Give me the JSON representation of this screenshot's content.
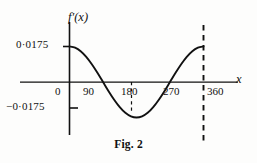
{
  "figure": {
    "caption": "Fig. 2",
    "axes": {
      "y_title": "f′(x)",
      "x_title": "x",
      "y_tick_positive": "0·0175",
      "y_tick_negative": "−0·0175",
      "origin_label": "0",
      "x_ticks": [
        "90",
        "180",
        "270",
        "360"
      ]
    },
    "colors": {
      "ink": "#111111",
      "background": "#fdfdfc",
      "curve": "#111111"
    }
  },
  "chart_data": {
    "type": "line",
    "title": "Fig. 2",
    "xlabel": "x",
    "ylabel": "f′(x)",
    "xlim": [
      0,
      375
    ],
    "ylim": [
      -0.0175,
      0.0175
    ],
    "xticks": [
      0,
      90,
      180,
      270,
      360
    ],
    "xticklabels": [
      "0",
      "90",
      "180",
      "270",
      "360"
    ],
    "yticks": [
      -0.0175,
      0.0175
    ],
    "yticklabels": [
      "−0·0175",
      "0·0175"
    ],
    "grid": false,
    "legend": null,
    "annotations": [
      {
        "type": "dashed-vertical",
        "x": 180,
        "from_y": 0,
        "to_y": -0.0175
      },
      {
        "type": "dashed-vertical",
        "x": 360,
        "from_y": 0.024,
        "to_y": -0.027
      }
    ],
    "series": [
      {
        "name": "f'(x)",
        "amplitude": 0.0175,
        "x": [
          0,
          15,
          30,
          45,
          60,
          75,
          90,
          105,
          120,
          135,
          150,
          165,
          180,
          195,
          210,
          225,
          240,
          255,
          270,
          285,
          300,
          315,
          330,
          345,
          360
        ],
        "y": [
          0.0175,
          0.0169,
          0.0152,
          0.0124,
          0.00875,
          0.00453,
          0.0,
          -0.00453,
          -0.00875,
          -0.0124,
          -0.0152,
          -0.0169,
          -0.0175,
          -0.0169,
          -0.0152,
          -0.0124,
          -0.00875,
          -0.00453,
          0.0,
          0.00453,
          0.00875,
          0.0124,
          0.0152,
          0.0169,
          0.0175
        ]
      }
    ]
  }
}
